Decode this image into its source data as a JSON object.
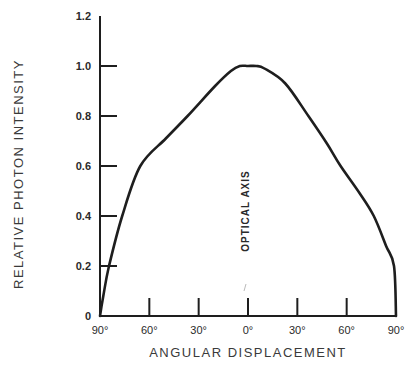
{
  "chart_data": {
    "type": "line",
    "title": "",
    "xlabel": "ANGULAR DISPLACEMENT",
    "ylabel": "RELATIVE PHOTON INTENSITY",
    "annotation": "OPTICAL AXIS",
    "x_ticks": [
      "90°",
      "60°",
      "30°",
      "0°",
      "30°",
      "60°",
      "90°"
    ],
    "x_tick_values": [
      -90,
      -60,
      -30,
      0,
      30,
      60,
      90
    ],
    "y_ticks": [
      "0",
      "0.2",
      "0.4",
      "0.6",
      "0.8",
      "1.0",
      "1.2"
    ],
    "y_tick_values": [
      0,
      0.2,
      0.4,
      0.6,
      0.8,
      1.0,
      1.2
    ],
    "xlim": [
      -90,
      90
    ],
    "ylim": [
      0,
      1.2
    ],
    "grid": false,
    "legend": null,
    "series": [
      {
        "name": "Relative photon intensity",
        "x": [
          -90,
          -88,
          -84.5,
          -76.5,
          -65.5,
          -50,
          -36.7,
          -20,
          -10.4,
          -5,
          0,
          5,
          10,
          22.7,
          36.7,
          48,
          56.3,
          68,
          76.5,
          84,
          88.8,
          90
        ],
        "y": [
          0,
          0.08,
          0.2,
          0.4,
          0.6,
          0.71,
          0.8,
          0.92,
          0.98,
          1.0,
          1.0,
          1.0,
          0.99,
          0.93,
          0.8,
          0.69,
          0.6,
          0.49,
          0.4,
          0.28,
          0.2,
          0
        ]
      }
    ]
  }
}
